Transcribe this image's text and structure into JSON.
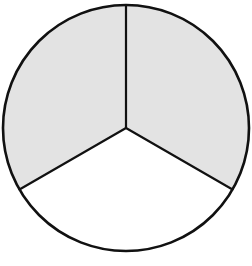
{
  "diagram": {
    "type": "fraction-circle",
    "fraction": {
      "numerator": 2,
      "denominator": 3,
      "label": "2/3"
    },
    "circle": {
      "cx": 126,
      "cy": 128,
      "r": 123
    },
    "sectors": [
      {
        "name": "top-right",
        "start_deg": -90,
        "end_deg": 30,
        "shaded": true
      },
      {
        "name": "bottom",
        "start_deg": 30,
        "end_deg": 150,
        "shaded": false
      },
      {
        "name": "top-left",
        "start_deg": 150,
        "end_deg": 270,
        "shaded": true
      }
    ],
    "colors": {
      "shaded": "#e3e3e3",
      "unshaded": "#ffffff",
      "stroke": "#111111"
    },
    "stroke_width": {
      "outline": 2.6,
      "spokes": 2.2
    }
  }
}
